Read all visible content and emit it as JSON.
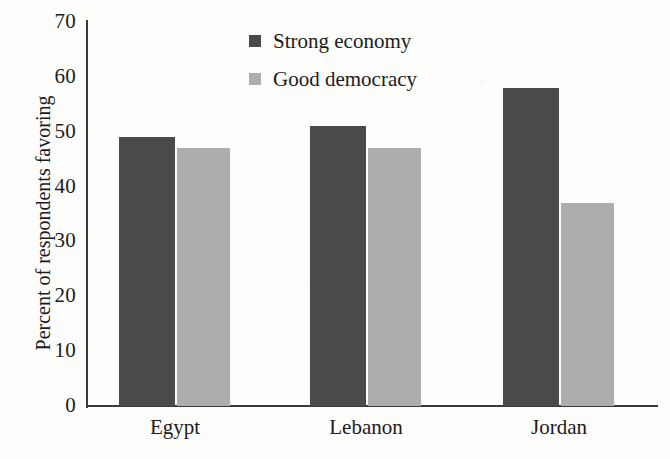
{
  "chart_data": {
    "type": "bar",
    "title": "",
    "xlabel": "",
    "ylabel": "Percent of respondents favoring",
    "categories": [
      "Egypt",
      "Lebanon",
      "Jordan"
    ],
    "series": [
      {
        "name": "Strong economy",
        "color": "#4a4a4a",
        "values": [
          49,
          51,
          58
        ]
      },
      {
        "name": "Good democracy",
        "color": "#adadad",
        "values": [
          47,
          47,
          37
        ]
      }
    ],
    "ylim": [
      0,
      70
    ],
    "yticks": [
      0,
      10,
      20,
      30,
      40,
      50,
      60,
      70
    ],
    "ytick_labels": [
      "0",
      "10",
      "20",
      "30",
      "40",
      "50",
      "60",
      "70"
    ],
    "grid": false,
    "legend_position": "top-center"
  },
  "axis": {
    "y_title": "Percent of respondents favoring",
    "ticks": [
      {
        "value": 70,
        "label": "70"
      },
      {
        "value": 60,
        "label": "60"
      },
      {
        "value": 50,
        "label": "50"
      },
      {
        "value": 40,
        "label": "40"
      },
      {
        "value": 30,
        "label": "30"
      },
      {
        "value": 20,
        "label": "20"
      },
      {
        "value": 10,
        "label": "10"
      },
      {
        "value": 0,
        "label": "0"
      }
    ]
  },
  "legend": {
    "items": [
      {
        "label": "Strong economy",
        "color": "#4a4a4a"
      },
      {
        "label": "Good democracy",
        "color": "#adadad"
      }
    ]
  },
  "categories": [
    {
      "label": "Egypt",
      "strong_economy": 49,
      "good_democracy": 47
    },
    {
      "label": "Lebanon",
      "strong_economy": 51,
      "good_democracy": 47
    },
    {
      "label": "Jordan",
      "strong_economy": 58,
      "good_democracy": 37
    }
  ],
  "colors": {
    "dark_bar": "#4a4a4a",
    "light_bar": "#adadad",
    "axis": "#3b3b3b",
    "background": "#fdfdfc",
    "text": "#1b1b1b"
  }
}
